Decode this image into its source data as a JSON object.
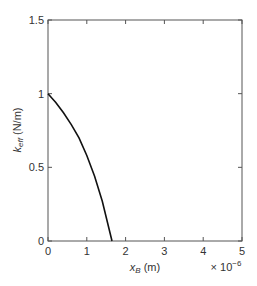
{
  "chart_data": {
    "type": "line",
    "title": "",
    "xlabel": "x_B (m)",
    "xlabel_main": "x",
    "xlabel_sub": "B",
    "xlabel_unit": " (m)",
    "ylabel": "k_eff (N/m)",
    "ylabel_main": "k",
    "ylabel_sub": "eff",
    "ylabel_unit": " (N/m)",
    "x_multiplier": "× 10",
    "x_multiplier_exp": "−6",
    "xlim": [
      0,
      5e-06
    ],
    "ylim": [
      0,
      1.5
    ],
    "xticks": [
      "0",
      "1",
      "2",
      "3",
      "4",
      "5"
    ],
    "yticks": [
      "0",
      "0.5",
      "1",
      "1.5"
    ],
    "grid": false,
    "legend": null,
    "series": [
      {
        "name": "k_eff",
        "color": "#111111",
        "x": [
          0,
          2e-07,
          4e-07,
          6e-07,
          8e-07,
          1e-06,
          1.2e-06,
          1.4e-06,
          1.65e-06
        ],
        "y": [
          1.0,
          0.94,
          0.87,
          0.79,
          0.7,
          0.58,
          0.44,
          0.27,
          0.0
        ]
      }
    ]
  }
}
